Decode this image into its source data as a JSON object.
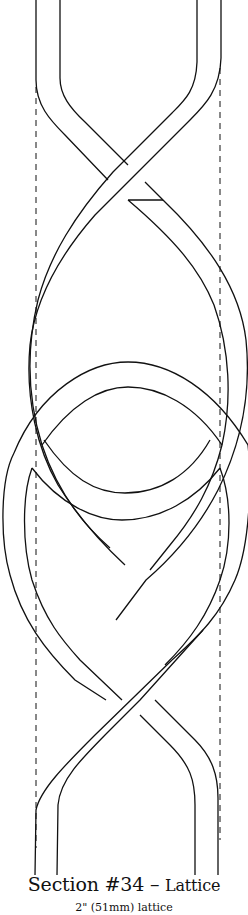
{
  "pattern": {
    "section_label": "Section #34",
    "separator": "–",
    "name": "Lattice",
    "subtitle": "2\" (51mm) lattice"
  },
  "colors": {
    "line": "#111111",
    "background": "#ffffff"
  }
}
